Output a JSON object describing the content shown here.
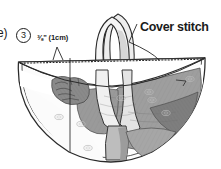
{
  "figure": {
    "kind": "sewing-instruction-illustration",
    "background_color": "#ffffff",
    "ink_color": "#1b1b1b",
    "fills": {
      "bag_light": "#f2f2f2",
      "fabric_light": "#e6e6e6",
      "fabric_mid": "#9e9e9e",
      "fabric_dark": "#7e7e7e",
      "strap_light": "#ededed",
      "strap_shade": "#cfcfcf"
    }
  },
  "labels": {
    "step_note": "e)",
    "step_number": "3",
    "seam_allowance": "⅜\" (1cm)",
    "cover_stitch": "Cover stitch"
  },
  "annotations": {
    "seam_leader": "leader line from seam allowance label down to the stitched rim",
    "cover_stitch_leader": "leader line from Cover stitch label down-left to the dashed rim stitching",
    "measure_line": "vertical measure line descending from the rim into the bag body",
    "stitch_line_style": "dotted"
  }
}
